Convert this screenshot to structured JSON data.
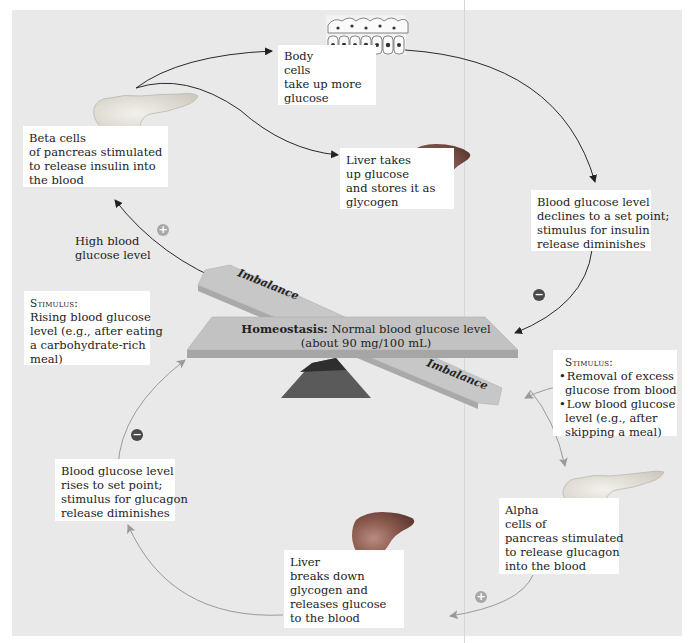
{
  "diagram": {
    "type": "negative-feedback-loop",
    "colors": {
      "background_panel": "#e9e9e9",
      "text_box": "#ffffff",
      "beam": "#bdbdbd",
      "fulcrum": "#5a5a5a",
      "arrow_dark": "#2a2a2a",
      "arrow_light": "#9a9a9a",
      "plus_sign": "#a8a8a8",
      "minus_sign": "#4a4a4a",
      "liver": "#8a5a4f",
      "pancreas": "#e6e2da"
    },
    "seesaw": {
      "homeostasis_bold": "Homeostasis:",
      "homeostasis_text": " Normal blood glucose level",
      "homeostasis_sub": "(about 90 mg/100 mL)",
      "imbalance_left": "Imbalance",
      "imbalance_right": "Imbalance"
    },
    "top_loop": {
      "high_label": [
        "High blood",
        "glucose level"
      ],
      "stimulus": {
        "heading": "Stimulus:",
        "lines": [
          "Rising blood glucose",
          "level (e.g., after eating",
          "a carbohydrate-rich",
          "meal)"
        ]
      },
      "beta_cells": [
        "Beta cells",
        "of pancreas stimulated",
        "to release insulin into",
        "the blood"
      ],
      "body_cells": [
        "Body",
        "cells",
        "take up more",
        "glucose"
      ],
      "liver_takes": [
        "Liver takes",
        "up glucose",
        "and stores it as",
        "glycogen"
      ],
      "declines": [
        "Blood glucose level",
        "declines to a set point;",
        "stimulus for insulin",
        "release diminishes"
      ],
      "signs": {
        "plus": "+",
        "minus": "−"
      }
    },
    "bottom_loop": {
      "stimulus": {
        "heading": "Stimulus:",
        "bullets": [
          [
            "Removal of excess",
            "glucose from blood"
          ],
          [
            "Low blood glucose",
            "level (e.g., after",
            "skipping a  meal)"
          ]
        ]
      },
      "alpha_cells": [
        "Alpha",
        "cells of",
        "pancreas stimulated",
        "to release glucagon",
        "into the blood"
      ],
      "liver_breaks": [
        "Liver",
        "breaks down",
        "glycogen and",
        "releases glucose",
        "to the blood"
      ],
      "rises": [
        "Blood glucose level",
        "rises to set point;",
        "stimulus for glucagon",
        "release diminishes"
      ],
      "signs": {
        "plus": "+",
        "minus": "−"
      }
    }
  }
}
